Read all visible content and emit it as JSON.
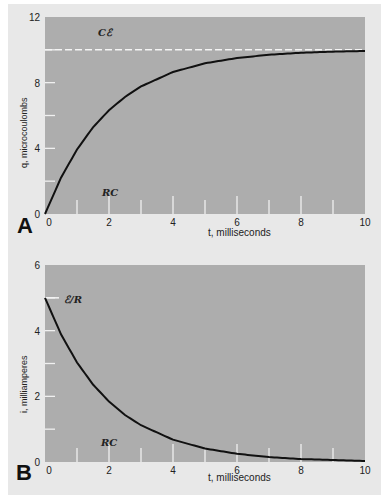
{
  "chart_data": [
    {
      "type": "line",
      "panel_label": "A",
      "title": "",
      "xlabel": "t, milliseconds",
      "ylabel": "q, microcoulombs",
      "xlim": [
        0,
        10
      ],
      "ylim": [
        0,
        12
      ],
      "x_ticks": [
        "0",
        "2",
        "4",
        "6",
        "8",
        "10"
      ],
      "y_ticks": [
        "0",
        "4",
        "8",
        "12"
      ],
      "annotations": [
        {
          "text": "Cℰ",
          "x": 2,
          "y": 10.6,
          "note": "dashed asymptote at q = 10"
        },
        {
          "text": "RC",
          "x": 2,
          "y": 1.6,
          "note": "time constant marker at t = 2"
        }
      ],
      "asymptote": 10,
      "series": [
        {
          "name": "q(t) = Cℰ(1 - e^(-t/RC))",
          "x": [
            0,
            0.5,
            1,
            1.5,
            2,
            2.5,
            3,
            4,
            5,
            6,
            7,
            8,
            9,
            10
          ],
          "values": [
            0,
            2.21,
            3.93,
            5.28,
            6.32,
            7.13,
            7.77,
            8.65,
            9.18,
            9.5,
            9.7,
            9.82,
            9.89,
            9.93
          ]
        }
      ],
      "grid": false
    },
    {
      "type": "line",
      "panel_label": "B",
      "title": "",
      "xlabel": "t, milliseconds",
      "ylabel": "i, milliamperes",
      "xlim": [
        0,
        10
      ],
      "ylim": [
        0,
        6
      ],
      "x_ticks": [
        "0",
        "2",
        "4",
        "6",
        "8",
        "10"
      ],
      "y_ticks": [
        "0",
        "2",
        "4",
        "6"
      ],
      "annotations": [
        {
          "text": "ℰ/R",
          "x": 0.3,
          "y": 5,
          "note": "initial current 5 mA"
        },
        {
          "text": "RC",
          "x": 2,
          "y": 0.6,
          "note": "time constant marker at t = 2"
        }
      ],
      "series": [
        {
          "name": "i(t) = (ℰ/R) e^(-t/RC)",
          "x": [
            0,
            0.5,
            1,
            1.5,
            2,
            2.5,
            3,
            4,
            5,
            6,
            7,
            8,
            9,
            10
          ],
          "values": [
            5,
            3.89,
            3.03,
            2.36,
            1.84,
            1.43,
            1.12,
            0.68,
            0.41,
            0.25,
            0.15,
            0.09,
            0.06,
            0.03
          ]
        }
      ],
      "grid": false
    }
  ],
  "labels": {
    "panelA": "A",
    "panelB": "B",
    "xlabelA": "t, milliseconds",
    "xlabelB": "t, milliseconds",
    "ylabelA": "q, microcoulombs",
    "ylabelB": "i, milliamperes",
    "annoA_top": "Cℰ",
    "annoA_rc": "RC",
    "annoB_top": "ℰ/R",
    "annoB_rc": "RC"
  },
  "colors": {
    "plot_bg": "#adadad",
    "paper_bg": "#e8e8e8",
    "curve": "#111111",
    "tick_marks": "#f2f2f2"
  }
}
